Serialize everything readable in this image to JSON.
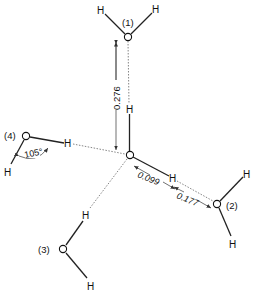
{
  "diagram": {
    "type": "hydrogen-bonded water cluster",
    "central_molecule": {
      "oxygen": "O",
      "hydrogens": [
        "H",
        "H"
      ]
    },
    "neighbors": [
      {
        "id": "1",
        "label": "(1)",
        "oxygen": "O",
        "hydrogens": [
          "H",
          "H"
        ]
      },
      {
        "id": "2",
        "label": "(2)",
        "oxygen": "O",
        "hydrogens": [
          "H",
          "H"
        ]
      },
      {
        "id": "3",
        "label": "(3)",
        "oxygen": "O",
        "hydrogens": [
          "H",
          "H"
        ]
      },
      {
        "id": "4",
        "label": "(4)",
        "oxygen": "O",
        "hydrogens": [
          "H",
          "H"
        ]
      }
    ],
    "measurements": {
      "oo_distance": "0.276",
      "oh_bond": "0.099",
      "h_bond": "0.177",
      "angle": "105°"
    },
    "atoms": {
      "O": "O",
      "H": "H"
    }
  }
}
